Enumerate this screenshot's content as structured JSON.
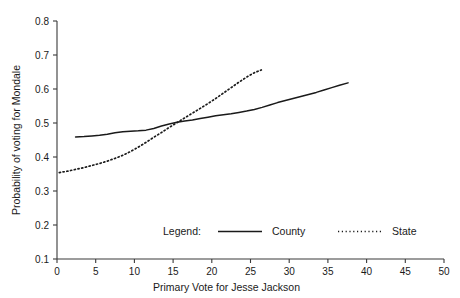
{
  "chart_data": {
    "type": "line",
    "title": "",
    "xlabel": "Primary Vote for Jesse Jackson",
    "ylabel": "Probability of voting for Mondale",
    "xlim": [
      0,
      50
    ],
    "ylim": [
      0.1,
      0.8
    ],
    "xticks": [
      0,
      5,
      10,
      15,
      20,
      25,
      30,
      35,
      40,
      45,
      50
    ],
    "xtick_labels": [
      "0",
      "5",
      "10",
      "15",
      "20",
      "25",
      "30",
      "35",
      "40",
      "45",
      "50"
    ],
    "yticks": [
      0.1,
      0.2,
      0.3,
      0.4,
      0.5,
      0.6,
      0.7,
      0.8
    ],
    "ytick_labels": [
      "0.1",
      "0.2",
      "0.3",
      "0.4",
      "0.5",
      "0.6",
      "0.7",
      "0.8"
    ],
    "grid": false,
    "legend_position": "lower-center",
    "legend_title": "Legend:",
    "series": [
      {
        "name": "County",
        "style": "solid",
        "color": "#1a1a1a",
        "points": [
          [
            2.4,
            0.459
          ],
          [
            3.5,
            0.46
          ],
          [
            4.5,
            0.462
          ],
          [
            5.5,
            0.464
          ],
          [
            6.5,
            0.467
          ],
          [
            7.5,
            0.471
          ],
          [
            8.5,
            0.474
          ],
          [
            9.5,
            0.476
          ],
          [
            10.5,
            0.477
          ],
          [
            11.5,
            0.479
          ],
          [
            12.5,
            0.484
          ],
          [
            13.5,
            0.491
          ],
          [
            14.5,
            0.497
          ],
          [
            15.5,
            0.502
          ],
          [
            16.5,
            0.506
          ],
          [
            17.5,
            0.509
          ],
          [
            18.5,
            0.513
          ],
          [
            19.5,
            0.517
          ],
          [
            20.5,
            0.521
          ],
          [
            21.5,
            0.524
          ],
          [
            22.5,
            0.527
          ],
          [
            23.5,
            0.531
          ],
          [
            24.5,
            0.535
          ],
          [
            25.5,
            0.54
          ],
          [
            26.5,
            0.546
          ],
          [
            27.5,
            0.553
          ],
          [
            28.5,
            0.56
          ],
          [
            29.5,
            0.566
          ],
          [
            30.5,
            0.572
          ],
          [
            31.5,
            0.578
          ],
          [
            32.5,
            0.584
          ],
          [
            33.5,
            0.59
          ],
          [
            34.5,
            0.597
          ],
          [
            35.5,
            0.604
          ],
          [
            36.5,
            0.611
          ],
          [
            37.6,
            0.618
          ]
        ]
      },
      {
        "name": "State",
        "style": "dotted",
        "color": "#1a1a1a",
        "points": [
          [
            0.3,
            0.354
          ],
          [
            1.5,
            0.359
          ],
          [
            2.5,
            0.364
          ],
          [
            3.5,
            0.369
          ],
          [
            4.5,
            0.375
          ],
          [
            5.5,
            0.381
          ],
          [
            6.5,
            0.388
          ],
          [
            7.5,
            0.396
          ],
          [
            8.5,
            0.405
          ],
          [
            9.5,
            0.416
          ],
          [
            10.5,
            0.429
          ],
          [
            11.5,
            0.443
          ],
          [
            12.5,
            0.458
          ],
          [
            13.5,
            0.472
          ],
          [
            14.5,
            0.487
          ],
          [
            15.5,
            0.501
          ],
          [
            16.5,
            0.515
          ],
          [
            17.5,
            0.529
          ],
          [
            18.5,
            0.543
          ],
          [
            19.5,
            0.557
          ],
          [
            20.5,
            0.572
          ],
          [
            21.5,
            0.588
          ],
          [
            22.5,
            0.604
          ],
          [
            23.5,
            0.62
          ],
          [
            24.5,
            0.635
          ],
          [
            25.5,
            0.648
          ],
          [
            26.4,
            0.656
          ]
        ]
      }
    ]
  },
  "legend": {
    "title": "Legend:",
    "entries": [
      {
        "label": "County",
        "style": "solid"
      },
      {
        "label": "State",
        "style": "dotted"
      }
    ]
  },
  "axes": {
    "x_title": "Primary Vote for Jesse Jackson",
    "y_title": "Probability of voting for Mondale"
  }
}
